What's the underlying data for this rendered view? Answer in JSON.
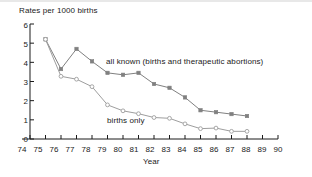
{
  "chart_data": {
    "type": "line",
    "title": "Rates per 1000 births",
    "subtitle": "",
    "xlabel": "Year",
    "ylabel": "Rates per 1000 births",
    "xlim": [
      74,
      90
    ],
    "ylim": [
      0,
      6
    ],
    "grid": false,
    "legend_position": "inline-annotations",
    "xticks": [
      "74",
      "75",
      "76",
      "77",
      "78",
      "79",
      "80",
      "81",
      "82",
      "83",
      "84",
      "85",
      "86",
      "87",
      "88",
      "89",
      "90"
    ],
    "yticks": [
      "0",
      "1",
      "2",
      "3",
      "4",
      "5",
      "6"
    ],
    "x": [
      75,
      76,
      77,
      78,
      79,
      80,
      81,
      82,
      83,
      84,
      85,
      86,
      87,
      88
    ],
    "series": [
      {
        "name": "all known (births and therapeutic abortions)",
        "marker": "filled-square",
        "color": "#808080",
        "values": [
          5.2,
          3.65,
          4.7,
          4.05,
          3.45,
          3.35,
          3.45,
          2.87,
          2.67,
          2.17,
          1.5,
          1.4,
          1.3,
          1.2
        ]
      },
      {
        "name": "births only",
        "marker": "open-circle",
        "color": "#9e9e9e",
        "values": [
          5.2,
          3.27,
          3.12,
          2.73,
          1.78,
          1.47,
          1.32,
          1.12,
          1.08,
          0.79,
          0.54,
          0.57,
          0.4,
          0.4
        ]
      }
    ],
    "annotations": [
      {
        "text": "all known (births and therapeutic abortions)",
        "x": 81,
        "y": 4.0
      },
      {
        "text": "births only",
        "x": 80,
        "y": 1.0
      }
    ]
  },
  "axes": {
    "x_title": "Year",
    "y_title": "Rates per 1000 births"
  },
  "style": {
    "axis_color": "#1a1a1a",
    "series_all_known_color": "#808080",
    "series_births_only_color": "#9e9e9e",
    "background": "#ffffff"
  }
}
